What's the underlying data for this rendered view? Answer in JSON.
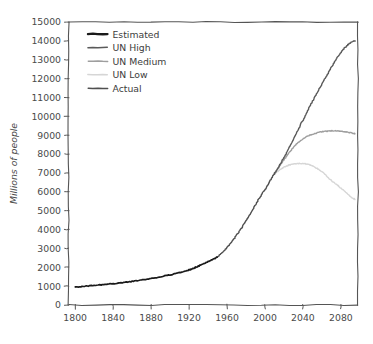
{
  "chart_data": {
    "type": "line",
    "title": "",
    "xlabel": "",
    "ylabel": "Millions of people",
    "xlim": [
      1793,
      2098
    ],
    "ylim": [
      0,
      15000
    ],
    "grid": false,
    "legend_position": "upper left",
    "xticks": [
      1800,
      1840,
      1880,
      1920,
      1960,
      2000,
      2040,
      2080
    ],
    "xtick_labels": [
      "1800",
      "1840",
      "1880",
      "1920",
      "1960",
      "2000",
      "2040",
      "2080"
    ],
    "yticks": [
      0,
      1000,
      2000,
      3000,
      4000,
      5000,
      6000,
      7000,
      8000,
      9000,
      10000,
      11000,
      12000,
      13000,
      14000,
      15000
    ],
    "ytick_labels": [
      "0",
      "1000",
      "2000",
      "3000",
      "4000",
      "5000",
      "6000",
      "7000",
      "8000",
      "9000",
      "10000",
      "11000",
      "12000",
      "13000",
      "14000",
      "15000"
    ],
    "series": [
      {
        "name": "Estimated",
        "color": "#1a1a1a",
        "width": 1.7,
        "x": [
          1800,
          1820,
          1840,
          1860,
          1880,
          1900,
          1920,
          1927,
          1940,
          1950
        ],
        "values": [
          950,
          1040,
          1130,
          1250,
          1400,
          1600,
          1860,
          2000,
          2300,
          2536
        ]
      },
      {
        "name": "UN High",
        "color": "#5a5a5a",
        "width": 1.4,
        "x": [
          2010,
          2020,
          2030,
          2040,
          2050,
          2060,
          2070,
          2080,
          2090,
          2095
        ],
        "values": [
          6957,
          7800,
          8800,
          9800,
          10800,
          11700,
          12600,
          13400,
          13900,
          14000
        ]
      },
      {
        "name": "UN Medium",
        "color": "#9e9e9e",
        "width": 1.4,
        "x": [
          2010,
          2020,
          2030,
          2040,
          2050,
          2060,
          2070,
          2080,
          2090,
          2095
        ],
        "values": [
          6957,
          7700,
          8350,
          8800,
          9050,
          9180,
          9230,
          9220,
          9130,
          9080
        ]
      },
      {
        "name": "UN Low",
        "color": "#d6d6d6",
        "width": 1.4,
        "x": [
          2010,
          2020,
          2030,
          2040,
          2050,
          2060,
          2070,
          2080,
          2090,
          2095
        ],
        "values": [
          6957,
          7300,
          7470,
          7500,
          7370,
          7060,
          6600,
          6200,
          5750,
          5600
        ]
      },
      {
        "name": "Actual",
        "color": "#4f4f4f",
        "width": 1.4,
        "x": [
          1950,
          1960,
          1970,
          1980,
          1990,
          2000,
          2010
        ],
        "values": [
          2536,
          3035,
          3700,
          4458,
          5320,
          6127,
          6957
        ]
      }
    ],
    "legend_entries": [
      {
        "label": "Estimated",
        "color": "#1a1a1a",
        "width": 2.3
      },
      {
        "label": "UN High",
        "color": "#5a5a5a",
        "width": 1.5
      },
      {
        "label": "UN Medium",
        "color": "#9e9e9e",
        "width": 1.5
      },
      {
        "label": "UN Low",
        "color": "#d6d6d6",
        "width": 1.5
      },
      {
        "label": "Actual",
        "color": "#4f4f4f",
        "width": 1.5
      }
    ]
  },
  "colors": {
    "background": "#ffffff",
    "axis": "#555555",
    "text": "#4a4a4a"
  }
}
